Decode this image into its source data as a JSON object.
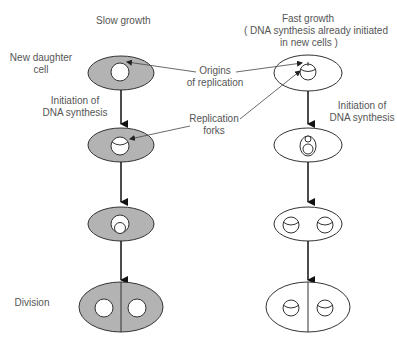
{
  "columns": {
    "slow": {
      "title": "Slow growth"
    },
    "fast": {
      "title": "Fast growth",
      "subtitle_line1": "( DNA synthesis already initiated",
      "subtitle_line2": "in new cells )"
    }
  },
  "stage_labels": {
    "new_daughter_line1": "New daughter",
    "new_daughter_line2": "cell",
    "initiation_slow_line1": "Initiation of",
    "initiation_slow_line2": "DNA synthesis",
    "initiation_fast_line1": "Initiation of",
    "initiation_fast_line2": "DNA synthesis",
    "division": "Division"
  },
  "annotations": {
    "origins_line1": "Origins",
    "origins_line2": "of replication",
    "forks_line1": "Replication",
    "forks_line2": "forks"
  },
  "colors": {
    "slow_cell_fill": "#b3b3b3",
    "fast_cell_fill": "#ffffff",
    "stroke": "#333333",
    "text": "#555555"
  },
  "caption": ""
}
